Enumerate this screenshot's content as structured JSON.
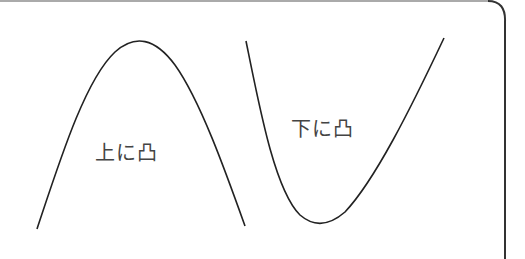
{
  "diagram": {
    "curves": [
      {
        "name": "concave-down-curve",
        "label": "上に凸",
        "shape": "downward-opening parabola"
      },
      {
        "name": "concave-up-curve",
        "label": "下に凸",
        "shape": "upward-opening parabola"
      }
    ],
    "colors": {
      "stroke": "#222222",
      "frame": "#333333",
      "frame_top": "#aaaaaa",
      "text": "#444444"
    }
  }
}
